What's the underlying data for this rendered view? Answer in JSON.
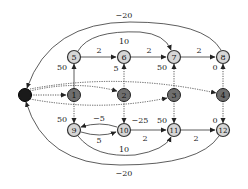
{
  "diagram": {
    "type": "directed-graph",
    "colors": {
      "source_fill": "#1a1a1a",
      "middle_fill": "#6e6e6e",
      "outer_fill": "#d6d6d6",
      "outer_stroke": "#333333",
      "edge": "#333333",
      "background": "#ffffff"
    },
    "nodes": [
      {
        "id": "s",
        "label": "",
        "x": 25,
        "y": 95,
        "kind": "source"
      },
      {
        "id": "1",
        "label": "1",
        "x": 74,
        "y": 95,
        "kind": "middle"
      },
      {
        "id": "2",
        "label": "2",
        "x": 124,
        "y": 95,
        "kind": "middle"
      },
      {
        "id": "3",
        "label": "3",
        "x": 174,
        "y": 95,
        "kind": "middle"
      },
      {
        "id": "4",
        "label": "4",
        "x": 223,
        "y": 95,
        "kind": "middle"
      },
      {
        "id": "5",
        "label": "5",
        "x": 74,
        "y": 57,
        "kind": "outer"
      },
      {
        "id": "6",
        "label": "6",
        "x": 124,
        "y": 57,
        "kind": "outer"
      },
      {
        "id": "7",
        "label": "7",
        "x": 174,
        "y": 57,
        "kind": "outer"
      },
      {
        "id": "8",
        "label": "8",
        "x": 223,
        "y": 57,
        "kind": "outer"
      },
      {
        "id": "9",
        "label": "9",
        "x": 74,
        "y": 130,
        "kind": "outer"
      },
      {
        "id": "10",
        "label": "10",
        "x": 124,
        "y": 130,
        "kind": "outer"
      },
      {
        "id": "11",
        "label": "11",
        "x": 174,
        "y": 130,
        "kind": "outer"
      },
      {
        "id": "12",
        "label": "12",
        "x": 223,
        "y": 130,
        "kind": "outer"
      }
    ],
    "edges": [
      {
        "from": "s",
        "to": "1",
        "style": "dotted",
        "label": ""
      },
      {
        "from": "s",
        "to": "2",
        "style": "dotted",
        "label": ""
      },
      {
        "from": "s",
        "to": "3",
        "style": "dotted",
        "label": ""
      },
      {
        "from": "s",
        "to": "4",
        "style": "dotted",
        "label": ""
      },
      {
        "from": "1",
        "to": "5",
        "style": "solid",
        "label": "50"
      },
      {
        "from": "1",
        "to": "9",
        "style": "dotted",
        "label": "50"
      },
      {
        "from": "2",
        "to": "6",
        "style": "dotted",
        "label": "5"
      },
      {
        "from": "2",
        "to": "10",
        "style": "dotted",
        "label": "−25"
      },
      {
        "from": "3",
        "to": "7",
        "style": "dotted",
        "label": "50"
      },
      {
        "from": "3",
        "to": "11",
        "style": "dotted",
        "label": "50"
      },
      {
        "from": "4",
        "to": "8",
        "style": "dotted",
        "label": "0"
      },
      {
        "from": "4",
        "to": "12",
        "style": "dotted",
        "label": "0"
      },
      {
        "from": "5",
        "to": "6",
        "style": "solid",
        "label": "2"
      },
      {
        "from": "6",
        "to": "7",
        "style": "solid",
        "label": "2"
      },
      {
        "from": "7",
        "to": "8",
        "style": "solid",
        "label": "2"
      },
      {
        "from": "5",
        "to": "7",
        "style": "solid",
        "label": "10"
      },
      {
        "from": "8",
        "to": "s",
        "style": "solid",
        "label": "−20"
      },
      {
        "from": "9",
        "to": "10",
        "style": "solid",
        "label": "5"
      },
      {
        "from": "10",
        "to": "9",
        "style": "solid",
        "label": "−5"
      },
      {
        "from": "10",
        "to": "11",
        "style": "solid",
        "label": "2"
      },
      {
        "from": "11",
        "to": "12",
        "style": "solid",
        "label": "2"
      },
      {
        "from": "9",
        "to": "11",
        "style": "solid",
        "label": "10"
      },
      {
        "from": "12",
        "to": "s",
        "style": "solid",
        "label": "−20"
      }
    ],
    "labels": {
      "n1": "1",
      "n2": "2",
      "n3": "3",
      "n4": "4",
      "n5": "5",
      "n6": "6",
      "n7": "7",
      "n8": "8",
      "n9": "9",
      "n10": "10",
      "n11": "11",
      "n12": "12",
      "e_1_5": "50",
      "e_1_9": "50",
      "e_2_6": "5",
      "e_2_10": "−25",
      "e_3_7": "50",
      "e_3_11": "50",
      "e_4_8": "0",
      "e_4_12": "0",
      "e_5_6": "2",
      "e_6_7": "2",
      "e_7_8": "2",
      "e_5_7": "10",
      "e_8_s": "−20",
      "e_9_10": "5",
      "e_10_9": "−5",
      "e_10_11": "2",
      "e_11_12": "2",
      "e_9_11": "10",
      "e_12_s": "−20"
    }
  }
}
